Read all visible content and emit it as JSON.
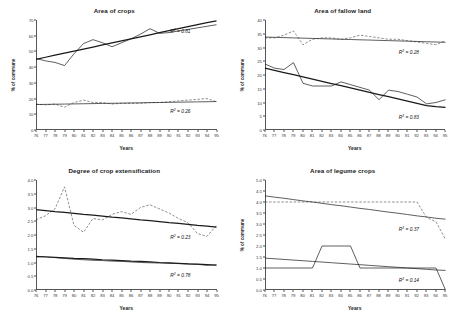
{
  "figure": {
    "shared": {
      "xlabel": "Years",
      "ylabel": "% of commune",
      "xticks": [
        "76",
        "77",
        "78",
        "79",
        "80",
        "81",
        "82",
        "83",
        "84",
        "85",
        "86",
        "87",
        "88",
        "89",
        "90",
        "91",
        "92",
        "93",
        "94",
        "95"
      ]
    }
  },
  "chart_data": [
    {
      "type": "line",
      "title": "Area of crops",
      "xlabel": "Years",
      "ylabel": "% of commune",
      "x": [
        76,
        77,
        78,
        79,
        80,
        81,
        82,
        83,
        84,
        85,
        86,
        87,
        88,
        89,
        90,
        91,
        92,
        93,
        94,
        95
      ],
      "xlim": [
        76,
        95
      ],
      "ylim": [
        0,
        70
      ],
      "yticks": [
        0,
        10,
        20,
        30,
        40,
        50,
        60,
        70
      ],
      "grid": false,
      "legend": "none",
      "series": [
        {
          "name": "upper-observed",
          "style": "solid-thin",
          "values": [
            45.5,
            44.0,
            43.0,
            41.0,
            48.5,
            55.0,
            57.5,
            55.5,
            53.0,
            55.5,
            58.0,
            61.0,
            64.5,
            61.5,
            62.0,
            63.0,
            64.0,
            65.0,
            66.0,
            67.0
          ]
        },
        {
          "name": "upper-trend",
          "style": "solid-thick",
          "values": [
            45.0,
            46.3,
            47.6,
            48.9,
            50.2,
            51.5,
            52.8,
            54.1,
            55.4,
            56.7,
            58.0,
            59.3,
            60.6,
            61.9,
            63.2,
            64.5,
            65.8,
            67.1,
            68.4,
            69.5
          ],
          "r2": 0.81,
          "r2_label": "R² = 0.81"
        },
        {
          "name": "lower-observed",
          "style": "dashed-thin",
          "values": [
            16.5,
            16.0,
            16.5,
            14.5,
            17.5,
            19.0,
            17.5,
            17.5,
            16.5,
            17.0,
            17.0,
            17.0,
            17.5,
            17.5,
            18.0,
            18.5,
            19.0,
            19.5,
            20.0,
            18.0
          ]
        },
        {
          "name": "lower-trend",
          "style": "solid-thin",
          "values": [
            16.2,
            16.3,
            16.4,
            16.5,
            16.6,
            16.7,
            16.8,
            16.9,
            17.0,
            17.1,
            17.2,
            17.3,
            17.4,
            17.5,
            17.6,
            17.7,
            17.8,
            17.9,
            18.0,
            18.1
          ],
          "r2": 0.26,
          "r2_label": "R² = 0.26"
        }
      ]
    },
    {
      "type": "line",
      "title": "Area of fallow land",
      "xlabel": "Years",
      "ylabel": "% of commune",
      "x": [
        76,
        77,
        78,
        79,
        80,
        81,
        82,
        83,
        84,
        85,
        86,
        87,
        88,
        89,
        90,
        91,
        92,
        93,
        94,
        95
      ],
      "xlim": [
        76,
        95
      ],
      "ylim": [
        0,
        40
      ],
      "yticks": [
        0,
        5,
        10,
        15,
        20,
        25,
        30,
        35,
        40
      ],
      "grid": false,
      "legend": "none",
      "series": [
        {
          "name": "upper-observed",
          "style": "dashed-thin",
          "values": [
            33.5,
            33.5,
            34.5,
            36.0,
            31.0,
            33.0,
            33.5,
            33.5,
            33.0,
            33.5,
            34.5,
            34.0,
            33.5,
            33.0,
            33.0,
            32.5,
            32.0,
            31.5,
            31.0,
            32.5
          ]
        },
        {
          "name": "upper-trend",
          "style": "solid-thin",
          "values": [
            33.8,
            33.7,
            33.6,
            33.5,
            33.4,
            33.3,
            33.2,
            33.1,
            33.0,
            32.9,
            32.8,
            32.7,
            32.6,
            32.5,
            32.4,
            32.3,
            32.2,
            32.1,
            32.0,
            31.9
          ],
          "r2": 0.28,
          "r2_label": "R² = 0.28"
        },
        {
          "name": "lower-observed",
          "style": "solid-thin",
          "values": [
            24.0,
            22.5,
            22.0,
            24.5,
            17.0,
            16.0,
            16.0,
            16.0,
            17.5,
            16.5,
            15.5,
            14.5,
            11.0,
            14.5,
            14.0,
            13.0,
            12.0,
            9.5,
            10.0,
            11.0
          ]
        },
        {
          "name": "lower-trend",
          "style": "solid-thick",
          "values": [
            22.5,
            21.7,
            20.9,
            20.1,
            19.3,
            18.5,
            17.7,
            16.9,
            16.1,
            15.3,
            14.5,
            13.7,
            12.9,
            12.1,
            11.3,
            10.5,
            9.7,
            8.9,
            8.5,
            8.2
          ],
          "r2": 0.83,
          "r2_label": "R² = 0.83"
        }
      ]
    },
    {
      "type": "line",
      "title": "Degree of crop extensification",
      "xlabel": "Years",
      "ylabel": "",
      "x": [
        76,
        77,
        78,
        79,
        80,
        81,
        82,
        83,
        84,
        85,
        86,
        87,
        88,
        89,
        90,
        91,
        92,
        93,
        94,
        95
      ],
      "xlim": [
        76,
        95
      ],
      "ylim": [
        0.0,
        4.0
      ],
      "yticks": [
        0.0,
        0.5,
        1.0,
        1.5,
        2.0,
        2.5,
        3.0,
        3.5,
        4.0
      ],
      "grid": false,
      "legend": "none",
      "series": [
        {
          "name": "upper-observed",
          "style": "dashed-thin",
          "values": [
            2.55,
            2.7,
            2.95,
            3.75,
            2.35,
            2.1,
            2.6,
            2.55,
            2.75,
            2.85,
            2.75,
            3.0,
            3.1,
            2.95,
            2.8,
            2.6,
            2.45,
            2.05,
            1.95,
            2.35
          ]
        },
        {
          "name": "upper-trend",
          "style": "solid-thick",
          "values": [
            2.92,
            2.89,
            2.85,
            2.82,
            2.79,
            2.75,
            2.72,
            2.69,
            2.65,
            2.62,
            2.59,
            2.55,
            2.52,
            2.49,
            2.45,
            2.42,
            2.39,
            2.35,
            2.32,
            2.29
          ],
          "r2": 0.23,
          "r2_label": "R² = 0.23"
        },
        {
          "name": "lower-observed",
          "style": "solid-thin",
          "values": [
            1.2,
            1.22,
            1.18,
            1.15,
            1.12,
            1.1,
            1.08,
            1.07,
            1.05,
            1.04,
            1.02,
            1.0,
            0.99,
            0.98,
            0.97,
            0.96,
            0.95,
            0.93,
            0.9,
            0.92
          ]
        },
        {
          "name": "lower-trend",
          "style": "solid-thick",
          "values": [
            1.22,
            1.2,
            1.19,
            1.17,
            1.15,
            1.14,
            1.12,
            1.1,
            1.09,
            1.07,
            1.05,
            1.04,
            1.02,
            1.0,
            0.99,
            0.97,
            0.95,
            0.94,
            0.92,
            0.9
          ],
          "r2": 0.78,
          "r2_label": "R² = 0.78"
        }
      ]
    },
    {
      "type": "line",
      "title": "Area of legume crops",
      "xlabel": "Years",
      "ylabel": "% of commune",
      "x": [
        76,
        77,
        78,
        79,
        80,
        81,
        82,
        83,
        84,
        85,
        86,
        87,
        88,
        89,
        90,
        91,
        92,
        93,
        94,
        95
      ],
      "xlim": [
        76,
        95
      ],
      "ylim": [
        0.0,
        5.0
      ],
      "yticks": [
        0.0,
        0.5,
        1.0,
        1.5,
        2.0,
        2.5,
        3.0,
        3.5,
        4.0,
        4.5,
        5.0
      ],
      "grid": false,
      "legend": "none",
      "series": [
        {
          "name": "upper-observed",
          "style": "dashed-thin",
          "values": [
            4.0,
            4.0,
            4.0,
            4.0,
            4.0,
            4.0,
            4.0,
            4.0,
            4.0,
            4.0,
            4.0,
            4.0,
            4.0,
            4.0,
            4.0,
            4.0,
            4.0,
            3.3,
            3.1,
            2.3
          ]
        },
        {
          "name": "upper-trend",
          "style": "solid-thin",
          "values": [
            4.28,
            4.22,
            4.17,
            4.11,
            4.05,
            4.0,
            3.94,
            3.88,
            3.83,
            3.77,
            3.71,
            3.66,
            3.6,
            3.54,
            3.49,
            3.43,
            3.37,
            3.32,
            3.26,
            3.22
          ],
          "r2": 0.37,
          "r2_label": "R² = 0.37"
        },
        {
          "name": "lower-observed",
          "style": "solid-thin",
          "values": [
            1.0,
            1.0,
            1.0,
            1.0,
            1.0,
            1.0,
            2.0,
            2.0,
            2.0,
            2.0,
            1.0,
            1.0,
            1.0,
            1.0,
            1.0,
            1.0,
            1.0,
            1.0,
            1.0,
            0.0
          ]
        },
        {
          "name": "lower-trend",
          "style": "solid-thin",
          "values": [
            1.45,
            1.42,
            1.39,
            1.36,
            1.33,
            1.3,
            1.27,
            1.24,
            1.21,
            1.18,
            1.15,
            1.12,
            1.09,
            1.06,
            1.03,
            1.0,
            0.97,
            0.94,
            0.91,
            0.89
          ],
          "r2": 0.14,
          "r2_label": "R² = 0.14"
        }
      ]
    }
  ]
}
